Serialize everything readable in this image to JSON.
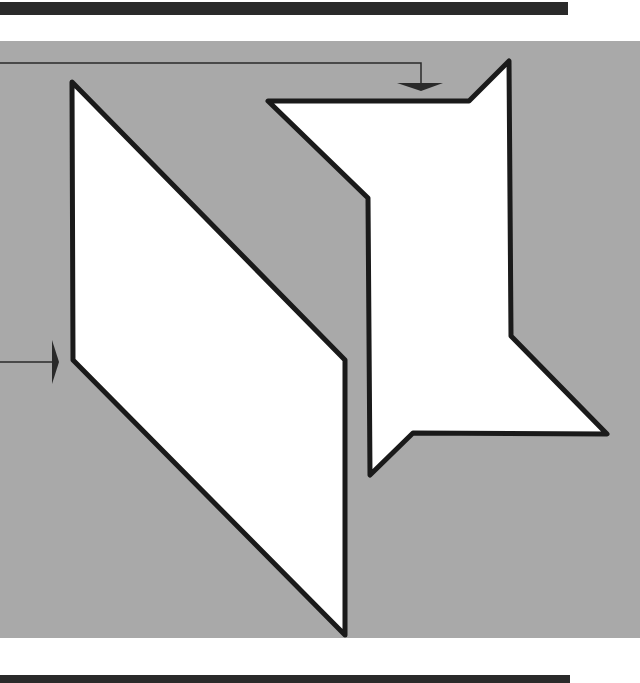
{
  "figure": {
    "colors": {
      "background_panel": "#a9a9a9",
      "shape_fill": "#ffffff",
      "outline": "#1a1a1a",
      "bars": "#2a2a2a"
    },
    "shapes": {
      "left_parallelogram": {
        "points": "72,82 345,360 345,635 73,360"
      },
      "right_shape": {
        "points": "268,101 469,101 509,61 511,336 607,434 413,433 370,475 368,198"
      }
    },
    "arrows": {
      "top_arrow": {
        "path": "M0,63 L421,63 L421,84",
        "head": "397,83 443,83 421,91"
      },
      "left_arrow": {
        "path": "M0,362 L52,362",
        "head": "52,340 52,384 59,362"
      }
    }
  }
}
